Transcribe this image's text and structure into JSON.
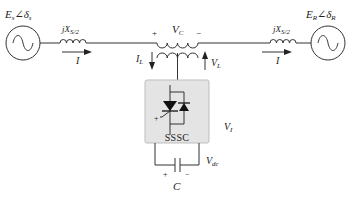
{
  "diagram": {
    "sending_source": {
      "label_main": "E",
      "label_sub": "s",
      "angle_symbol": "∠",
      "angle_main": "δ",
      "angle_sub": "s"
    },
    "receiving_source": {
      "label_main": "E",
      "label_sub": "R",
      "angle_symbol": "∠",
      "angle_main": "δ",
      "angle_sub": "R"
    },
    "left_reactance": {
      "label_main": "jX",
      "label_sub": "S/2"
    },
    "right_reactance": {
      "label_main": "jX",
      "label_sub": "S/2"
    },
    "left_current": {
      "label": "I"
    },
    "right_current": {
      "label": "I"
    },
    "series_voltage": {
      "label_main": "V",
      "label_sub": "C",
      "plus": "+",
      "minus": "−"
    },
    "injected_current": {
      "label_main": "I",
      "label_sub": "L"
    },
    "injected_voltage": {
      "label_main": "V",
      "label_sub": "L"
    },
    "converter": {
      "label": "SSSC",
      "output_voltage_main": "V",
      "output_voltage_sub": "I"
    },
    "dc_link": {
      "voltage_main": "V",
      "voltage_sub": "dc",
      "capacitor_label": "C",
      "plus": "+",
      "minus": "−"
    },
    "colors": {
      "line": "#333333",
      "box_fill": "#e4e4e4",
      "box_stroke": "#bdbdbd",
      "text": "#222222"
    }
  }
}
